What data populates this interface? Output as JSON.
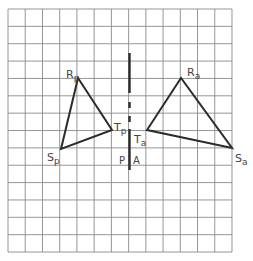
{
  "diagram": {
    "type": "reflection-on-grid",
    "grid": {
      "columns": 13,
      "rows": 14,
      "origin_x": 8,
      "origin_y": 9,
      "cell_width": 17.23,
      "cell_height": 17.36,
      "line_color": "#8a8a8a"
    },
    "mirror_line": {
      "x": 129.5,
      "segments": [
        [
          53,
          93
        ],
        [
          102,
          108
        ],
        [
          116,
          122
        ],
        [
          129,
          170
        ]
      ],
      "color": "#2b2b2b"
    },
    "triangles": [
      {
        "name": "preimage",
        "color": "#2b2b2b",
        "vertices": [
          {
            "id": "R",
            "label": "R",
            "sub": "p",
            "x": 78,
            "y": 78,
            "lx": 66,
            "ly": 74
          },
          {
            "id": "T",
            "label": "T",
            "sub": "p",
            "x": 112,
            "y": 130,
            "lx": 115,
            "ly": 127
          },
          {
            "id": "S",
            "label": "S",
            "sub": "p",
            "x": 61,
            "y": 149,
            "lx": 47,
            "ly": 161
          }
        ]
      },
      {
        "name": "image",
        "color": "#2b2b2b",
        "vertices": [
          {
            "id": "R",
            "label": "R",
            "sub": "a",
            "x": 181,
            "y": 78,
            "lx": 187,
            "ly": 74
          },
          {
            "id": "T",
            "label": "T",
            "sub": "a",
            "x": 147,
            "y": 130,
            "lx": 134,
            "ly": 144
          },
          {
            "id": "S",
            "label": "S",
            "sub": "a",
            "x": 232,
            "y": 148,
            "lx": 235,
            "ly": 163
          }
        ]
      }
    ],
    "axis_labels": [
      {
        "text": "P",
        "x": 119,
        "y": 165
      },
      {
        "text": "A",
        "x": 134,
        "y": 165
      }
    ],
    "labels": {
      "Rp_main": "R",
      "Rp_sub": "p",
      "Tp_main": "T",
      "Tp_sub": "p",
      "Sp_main": "S",
      "Sp_sub": "p",
      "Ra_main": "R",
      "Ra_sub": "a",
      "Ta_main": "T",
      "Ta_sub": "a",
      "Sa_main": "S",
      "Sa_sub": "a",
      "P": "P",
      "A": "A"
    }
  }
}
